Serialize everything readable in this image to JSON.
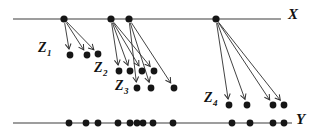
{
  "figure": {
    "width": 321,
    "height": 134,
    "background": "#ffffff",
    "ink_color": "#161616",
    "line_color": "#3c3c3c",
    "arrow_color": "#2e2e2e",
    "dot_radius": 3.4,
    "x_line": {
      "label": "X",
      "y": 19,
      "x1": 13,
      "x2": 281,
      "label_x": 288,
      "label_y": 7,
      "points": [
        64,
        111,
        129,
        216
      ]
    },
    "y_line": {
      "label": "Y",
      "y": 123,
      "x1": 13,
      "x2": 292,
      "label_x": 296,
      "label_y": 112,
      "points": [
        69,
        86,
        98,
        118,
        130,
        137,
        143,
        153,
        173,
        232,
        250,
        273,
        284
      ]
    },
    "groups": [
      {
        "label_base": "Z",
        "label_sub": "1",
        "label_x": 38,
        "label_y": 41,
        "source_index": 0,
        "dots": [
          [
            70,
            55
          ],
          [
            87,
            55
          ],
          [
            98,
            54
          ]
        ]
      },
      {
        "label_base": "Z",
        "label_sub": "2",
        "label_x": 94,
        "label_y": 61,
        "source_index": 1,
        "dots": [
          [
            119,
            71
          ],
          [
            130,
            71
          ],
          [
            142,
            71
          ],
          [
            154,
            71
          ]
        ]
      },
      {
        "label_base": "Z",
        "label_sub": "3",
        "label_x": 115,
        "label_y": 79,
        "source_index": 2,
        "dots": [
          [
            137,
            88
          ],
          [
            151,
            88
          ],
          [
            174,
            88
          ]
        ]
      },
      {
        "label_base": "Z",
        "label_sub": "4",
        "label_x": 204,
        "label_y": 91,
        "source_index": 3,
        "dots": [
          [
            229,
            105
          ],
          [
            247,
            105
          ],
          [
            273,
            105
          ],
          [
            284,
            105
          ]
        ]
      }
    ]
  }
}
